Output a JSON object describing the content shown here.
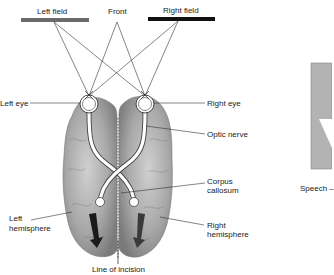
{
  "labels": {
    "left_field": "Left field",
    "front": "Front",
    "right_field": "Right field",
    "left_eye": "Left eye",
    "right_eye": "Right eye",
    "optic_nerve": "Optic nerve",
    "corpus_callosum_1": "Corpus",
    "corpus_callosum_2": "callosum",
    "left_hemisphere_1": "Left",
    "left_hemisphere_2": "hemisphere",
    "right_hemisphere_1": "Right",
    "right_hemisphere_2": "hemisphere",
    "line_of_incision": "Line of incision",
    "speech": "Speech –"
  },
  "colors": {
    "left_field_bar": "#6b6b6b",
    "right_field_bar": "#111111",
    "brain": "#9a9a9a",
    "right_panel": "#b3b3b3"
  },
  "icons": {
    "left_arrow": "down-arrow-icon",
    "right_arrow": "down-arrow-icon"
  }
}
